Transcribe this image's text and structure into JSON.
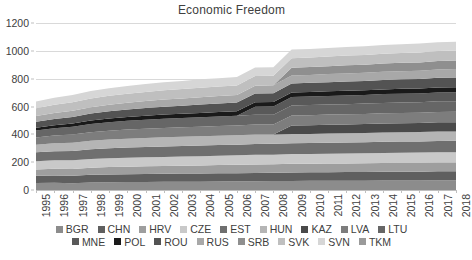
{
  "chart_data": {
    "type": "area",
    "stacked": true,
    "title": "Economic Freedom",
    "subtitle": "",
    "xlabel": "",
    "ylabel": "",
    "xlim": [
      1995,
      2018
    ],
    "ylim": [
      0,
      1200
    ],
    "y_ticks": [
      0,
      200,
      400,
      600,
      800,
      1000,
      1200
    ],
    "grid": true,
    "legend_position": "bottom",
    "categories": [
      "1995",
      "1996",
      "1997",
      "1998",
      "1999",
      "2000",
      "2001",
      "2002",
      "2003",
      "2004",
      "2005",
      "2006",
      "2007",
      "2008",
      "2009",
      "2010",
      "2011",
      "2012",
      "2013",
      "2014",
      "2015",
      "2016",
      "2017",
      "2018"
    ],
    "series": [
      {
        "name": "BGR",
        "color": "#8c8c8c",
        "values": [
          50,
          52,
          48,
          54,
          56,
          57,
          58,
          59,
          60,
          60,
          61,
          62,
          63,
          64,
          65,
          66,
          66,
          67,
          67,
          68,
          69,
          69,
          70,
          70
        ]
      },
      {
        "name": "CHN",
        "color": "#5f5f5f",
        "values": [
          52,
          53,
          54,
          55,
          56,
          56,
          57,
          57,
          58,
          58,
          59,
          59,
          60,
          60,
          61,
          61,
          62,
          62,
          62,
          63,
          63,
          63,
          64,
          64
        ]
      },
      {
        "name": "HRV",
        "color": "#9e9e9e",
        "values": [
          45,
          47,
          49,
          51,
          53,
          54,
          55,
          56,
          57,
          58,
          59,
          60,
          61,
          61,
          62,
          62,
          62,
          62,
          63,
          63,
          63,
          64,
          64,
          64
        ]
      },
      {
        "name": "CZE",
        "color": "#c9c9c9",
        "values": [
          60,
          61,
          62,
          63,
          64,
          65,
          65,
          66,
          66,
          67,
          67,
          68,
          69,
          69,
          70,
          70,
          71,
          71,
          72,
          72,
          73,
          73,
          74,
          74
        ]
      },
      {
        "name": "EST",
        "color": "#6f6f6f",
        "values": [
          64,
          66,
          68,
          70,
          71,
          73,
          74,
          75,
          76,
          76,
          77,
          77,
          78,
          78,
          78,
          78,
          79,
          79,
          79,
          80,
          80,
          80,
          80,
          81
        ]
      },
      {
        "name": "HUN",
        "color": "#b5b5b5",
        "values": [
          55,
          57,
          59,
          61,
          63,
          64,
          65,
          66,
          66,
          67,
          67,
          67,
          67,
          66,
          66,
          66,
          66,
          66,
          67,
          67,
          67,
          67,
          68,
          68
        ]
      },
      {
        "name": "KAZ",
        "color": "#4a4a4a",
        "values": [
          0,
          0,
          0,
          0,
          0,
          0,
          0,
          0,
          0,
          0,
          0,
          0,
          0,
          0,
          62,
          63,
          63,
          64,
          64,
          65,
          65,
          65,
          66,
          66
        ]
      },
      {
        "name": "LVA",
        "color": "#7d7d7d",
        "values": [
          52,
          55,
          58,
          61,
          63,
          65,
          66,
          67,
          68,
          69,
          70,
          71,
          72,
          72,
          72,
          72,
          73,
          73,
          73,
          74,
          74,
          74,
          75,
          75
        ]
      },
      {
        "name": "LTU",
        "color": "#666666",
        "values": [
          50,
          53,
          56,
          59,
          61,
          63,
          65,
          66,
          67,
          68,
          69,
          70,
          71,
          71,
          72,
          72,
          73,
          73,
          74,
          74,
          75,
          75,
          76,
          76
        ]
      },
      {
        "name": "MNE",
        "color": "#595959",
        "values": [
          0,
          0,
          0,
          0,
          0,
          0,
          0,
          0,
          0,
          0,
          0,
          0,
          58,
          59,
          60,
          61,
          61,
          62,
          62,
          63,
          63,
          64,
          64,
          65
        ]
      },
      {
        "name": "POL",
        "color": "#1a1a1a",
        "values": [
          20,
          22,
          24,
          26,
          27,
          28,
          29,
          30,
          30,
          31,
          31,
          32,
          32,
          32,
          33,
          33,
          33,
          34,
          34,
          34,
          35,
          35,
          36,
          36
        ]
      },
      {
        "name": "ROU",
        "color": "#535353",
        "values": [
          43,
          45,
          47,
          49,
          51,
          53,
          55,
          57,
          58,
          60,
          61,
          62,
          63,
          64,
          65,
          66,
          66,
          67,
          67,
          68,
          68,
          69,
          69,
          70
        ]
      },
      {
        "name": "RUS",
        "color": "#a8a8a8",
        "values": [
          40,
          42,
          44,
          46,
          48,
          49,
          50,
          51,
          52,
          53,
          54,
          55,
          56,
          56,
          57,
          57,
          58,
          58,
          58,
          59,
          59,
          59,
          60,
          60
        ]
      },
      {
        "name": "SRB",
        "color": "#8f8f8f",
        "values": [
          0,
          0,
          0,
          0,
          0,
          0,
          0,
          0,
          0,
          0,
          0,
          0,
          0,
          0,
          55,
          56,
          57,
          58,
          58,
          59,
          60,
          60,
          61,
          62
        ]
      },
      {
        "name": "SVK",
        "color": "#bfbfbf",
        "values": [
          57,
          59,
          61,
          63,
          64,
          65,
          66,
          67,
          67,
          68,
          68,
          68,
          69,
          69,
          69,
          69,
          69,
          70,
          70,
          70,
          70,
          71,
          71,
          71
        ]
      },
      {
        "name": "SVN",
        "color": "#d6d6d6",
        "values": [
          48,
          50,
          52,
          54,
          55,
          56,
          57,
          58,
          59,
          60,
          60,
          61,
          61,
          61,
          62,
          62,
          62,
          62,
          63,
          63,
          63,
          64,
          64,
          64
        ]
      },
      {
        "name": "TKM",
        "color": "#9a9a9a",
        "values": [
          0,
          0,
          0,
          0,
          0,
          0,
          0,
          0,
          0,
          0,
          0,
          0,
          0,
          0,
          0,
          0,
          0,
          0,
          0,
          0,
          0,
          0,
          0,
          0
        ]
      }
    ]
  },
  "legend": {
    "rows": [
      [
        {
          "label": "BGR",
          "color": "#8c8c8c"
        },
        {
          "label": "CHN",
          "color": "#5f5f5f"
        },
        {
          "label": "HRV",
          "color": "#9e9e9e"
        },
        {
          "label": "CZE",
          "color": "#c9c9c9"
        },
        {
          "label": "EST",
          "color": "#6f6f6f"
        },
        {
          "label": "HUN",
          "color": "#b5b5b5"
        },
        {
          "label": "KAZ",
          "color": "#4a4a4a"
        },
        {
          "label": "LVA",
          "color": "#7d7d7d"
        },
        {
          "label": "LTU",
          "color": "#666666"
        }
      ],
      [
        {
          "label": "MNE",
          "color": "#595959"
        },
        {
          "label": "POL",
          "color": "#1a1a1a"
        },
        {
          "label": "ROU",
          "color": "#535353"
        },
        {
          "label": "RUS",
          "color": "#a8a8a8"
        },
        {
          "label": "SRB",
          "color": "#8f8f8f"
        },
        {
          "label": "SVK",
          "color": "#bfbfbf"
        },
        {
          "label": "SVN",
          "color": "#d6d6d6"
        },
        {
          "label": "TKM",
          "color": "#9a9a9a"
        }
      ]
    ]
  },
  "style": {
    "gridline_color": "#d9d9d9",
    "axis_color": "#bfbfbf",
    "text_color": "#404040",
    "background": "#ffffff"
  }
}
